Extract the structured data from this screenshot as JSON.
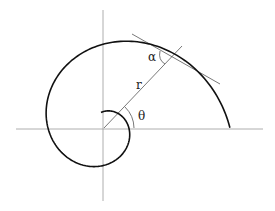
{
  "diagram": {
    "labels": {
      "alpha": "α",
      "radius": "r",
      "theta": "θ"
    },
    "colors": {
      "curve": "#111111",
      "axes": "#888888",
      "lines": "#555555"
    }
  }
}
